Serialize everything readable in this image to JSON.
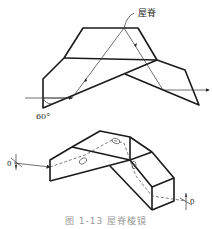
{
  "figure": {
    "top_view": {
      "ridge_label": "屋脊",
      "angle_label": "60°"
    },
    "bottom_view": {
      "input_axis_label": "0",
      "output_axis_label": "0"
    },
    "caption": "图 1-13  屋脊棱镜"
  }
}
